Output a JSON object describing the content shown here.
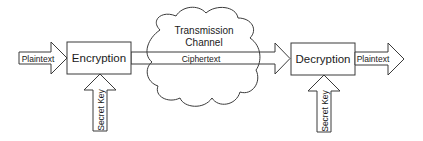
{
  "diagram": {
    "nodes": {
      "encryption": {
        "label": "Encryption"
      },
      "decryption": {
        "label": "Decryption"
      },
      "channel": {
        "label_line1": "Transmission",
        "label_line2": "Channel"
      }
    },
    "arrows": {
      "input": {
        "label": "Plaintext"
      },
      "cipher": {
        "label": "Ciphertext"
      },
      "output": {
        "label": "Plaintext"
      },
      "key_enc": {
        "label": "Secret Key"
      },
      "key_dec": {
        "label": "Secret Key"
      }
    },
    "colors": {
      "stroke": "#3a3a3a",
      "fill": "#ffffff",
      "text": "#1a1a1a"
    }
  }
}
